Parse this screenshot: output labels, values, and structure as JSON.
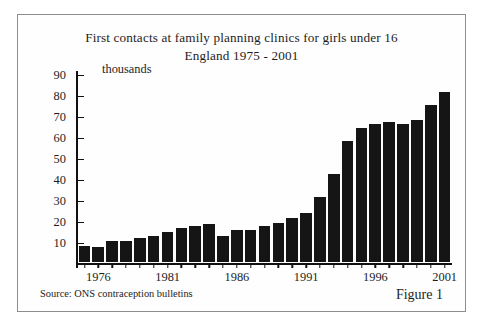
{
  "figure": {
    "title_line_1": "First contacts at family planning clinics for girls under 16",
    "title_line_2": "England 1975 - 2001",
    "units_label": "thousands",
    "source_note": "Source: ONS contraception bulletins",
    "figure_number": "Figure 1",
    "bar_color": "#151515",
    "axis_color": "#111111",
    "frame_color": "#8d8d8d",
    "background_color": "#ffffff"
  },
  "chart_data": {
    "type": "bar",
    "title": "First contacts at family planning clinics for girls under 16 England 1975 - 2001",
    "xlabel": "",
    "ylabel": "thousands",
    "ylim": [
      0,
      90
    ],
    "ytick_labels": [
      "10",
      "20",
      "30",
      "40",
      "50",
      "60",
      "70",
      "80",
      "90"
    ],
    "ytick_values": [
      10,
      20,
      30,
      40,
      50,
      60,
      70,
      80,
      90
    ],
    "xtick_labels": [
      "1976",
      "1981",
      "1986",
      "1991",
      "1996",
      "2001"
    ],
    "xtick_values": [
      1976,
      1981,
      1986,
      1991,
      1996,
      2001
    ],
    "grid": false,
    "legend": false,
    "categories": [
      1975,
      1976,
      1977,
      1978,
      1979,
      1980,
      1981,
      1982,
      1983,
      1984,
      1985,
      1986,
      1987,
      1988,
      1989,
      1990,
      1991,
      1992,
      1993,
      1994,
      1995,
      1996,
      1997,
      1998,
      1999,
      2000,
      2001
    ],
    "values": [
      8,
      7.5,
      10,
      10,
      11.5,
      12.5,
      14.5,
      16.5,
      17.5,
      18.5,
      12.5,
      15.5,
      15.5,
      17.5,
      19,
      21,
      23.5,
      31,
      42,
      58,
      64,
      66,
      67,
      66,
      68,
      75,
      81
    ],
    "source": "Source: ONS contraception bulletins"
  }
}
